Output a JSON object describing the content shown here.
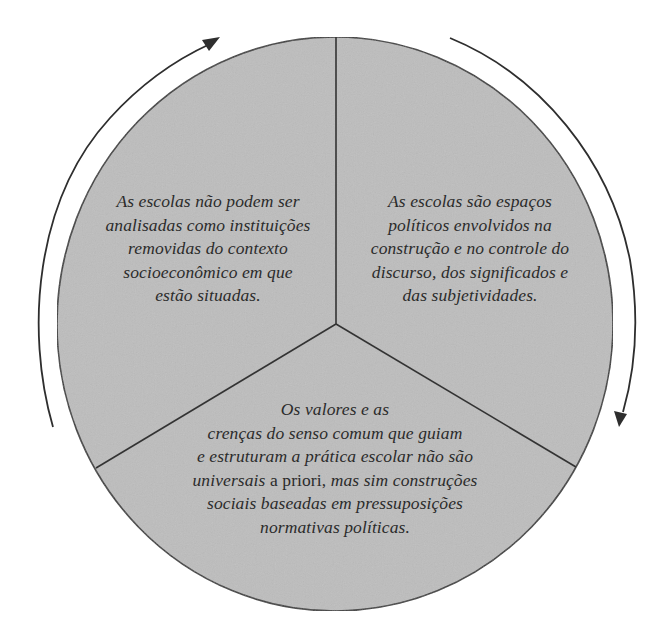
{
  "diagram": {
    "type": "three-segment-cycle",
    "colors": {
      "fill": "#bdbdbd",
      "stroke": "#3a3a3a",
      "text": "#2b2b2b",
      "background": "#ffffff"
    },
    "cycle_direction": "clockwise",
    "segments": [
      {
        "position": "top-left",
        "lines": [
          "As escolas não podem ser",
          "analisadas como instituições",
          "removidas do contexto",
          "socioeconômico em que",
          "estão situadas."
        ]
      },
      {
        "position": "top-right",
        "lines": [
          "As escolas são espaços",
          "políticos envolvidos na",
          "construção e no controle do",
          "discurso, dos significados e",
          "das subjetividades."
        ]
      },
      {
        "position": "bottom",
        "lines": [
          "Os valores e as",
          "crenças do senso comum que guiam",
          "e estruturam a prática escolar não são",
          "universais",
          "a priori,",
          "mas sim construções",
          "sociais baseadas em pressuposições",
          "normativas políticas."
        ]
      }
    ],
    "arrows": [
      {
        "name": "left-arc-arrow",
        "direction": "up-clockwise"
      },
      {
        "name": "right-arc-arrow",
        "direction": "down-clockwise"
      }
    ]
  }
}
